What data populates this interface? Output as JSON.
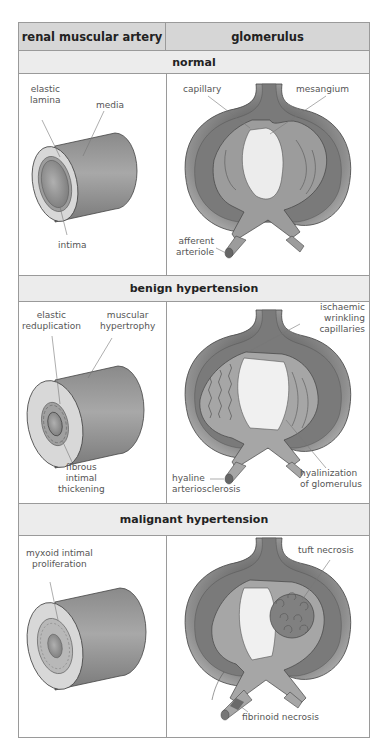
{
  "header": {
    "left": "renal muscular artery",
    "right": "glomerulus"
  },
  "rows": [
    {
      "band": "normal",
      "artery_labels": {
        "a": "elastic",
        "a2": "lamina",
        "b": "media",
        "c": "intima"
      },
      "glom_labels": {
        "a": "capillary",
        "b": "mesangium",
        "c": "afferent",
        "c2": "arteriole"
      }
    },
    {
      "band": "benign hypertension",
      "artery_labels": {
        "a": "elastic",
        "a2": "reduplication",
        "b": "muscular",
        "b2": "hypertrophy",
        "c": "fibrous",
        "c2": "intimal",
        "c3": "thickening"
      },
      "glom_labels": {
        "a": "ischaemic",
        "a2": "wrinkling",
        "a3": "capillaries",
        "b": "hyaline",
        "b2": "arteriosclerosis",
        "c": "hyalinization",
        "c2": "of glomerulus"
      }
    },
    {
      "band": "malignant hypertension",
      "artery_labels": {
        "a": "myxoid intimal",
        "a2": "proliferation"
      },
      "glom_labels": {
        "a": "tuft necrosis",
        "b": "fibrinoid necrosis"
      }
    }
  ],
  "colors": {
    "header_bg": "#d6d6d6",
    "band_bg": "#ececec",
    "border": "#9a9a9a",
    "tissue_mid": "#9c9c9c",
    "tissue_light": "#d0d0d0",
    "tissue_lightest": "#ececec"
  }
}
